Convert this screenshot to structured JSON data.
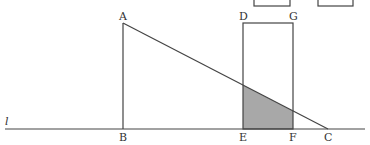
{
  "diagram": {
    "colors": {
      "stroke": "#444444",
      "shade": "#a8a8a8",
      "background": "#ffffff"
    },
    "line_label": "l",
    "points": {
      "A": "A",
      "B": "B",
      "C": "C",
      "D": "D",
      "E": "E",
      "F": "F",
      "G": "G"
    },
    "shapes": [
      {
        "name": "right-triangle-ABC",
        "vertices": [
          "A",
          "B",
          "C"
        ]
      },
      {
        "name": "rectangle-DEFG",
        "vertices": [
          "D",
          "E",
          "F",
          "G"
        ]
      },
      {
        "name": "shaded-overlap-region",
        "description": "part of rectangle DEFG under segment AC"
      }
    ]
  }
}
